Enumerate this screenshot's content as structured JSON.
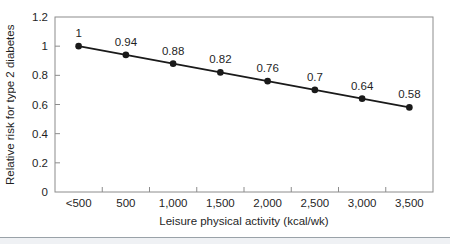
{
  "chart_data": {
    "type": "line",
    "categories": [
      "<500",
      "500",
      "1,000",
      "1,500",
      "2,000",
      "2,500",
      "3,000",
      "3,500"
    ],
    "values": [
      1,
      0.94,
      0.88,
      0.82,
      0.76,
      0.7,
      0.64,
      0.58
    ],
    "point_labels": [
      "1",
      "0.94",
      "0.88",
      "0.82",
      "0.76",
      "0.7",
      "0.64",
      "0.58"
    ],
    "series_name": "Relative risk",
    "title": "",
    "xlabel": "Leisure physical activity (kcal/wk)",
    "ylabel": "Relative risk for type 2 diabetes",
    "ylim": [
      0,
      1.2
    ],
    "yticks": [
      0,
      0.2,
      0.4,
      0.6,
      0.8,
      1,
      1.2
    ],
    "ytick_labels": [
      "0",
      "0.2",
      "0.4",
      "0.6",
      "0.8",
      "1",
      "1.2"
    ],
    "grid": false,
    "legend_position": "none",
    "line_color": "#1a1a1a",
    "marker_color": "#1a1a1a",
    "text_color": "#1f1f1f",
    "spine_color": "#8c8c8c",
    "tick_color": "#8c8c8c",
    "divider_color": "#9aa2a8",
    "footer_bg": "#eff1f4",
    "background": "#ffffff"
  }
}
